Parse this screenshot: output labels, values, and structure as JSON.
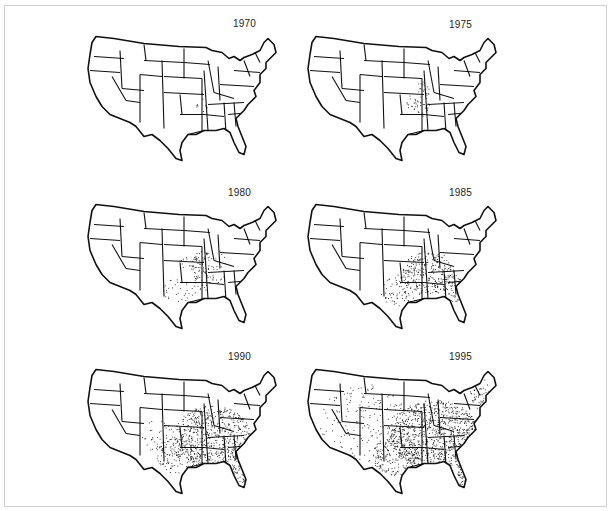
{
  "figure": {
    "panels": [
      {
        "year": "1970",
        "density": 0.02,
        "core": "arkansas"
      },
      {
        "year": "1975",
        "density": 0.08,
        "core": "arkansas-missouri"
      },
      {
        "year": "1980",
        "density": 0.18,
        "core": "south-central"
      },
      {
        "year": "1985",
        "density": 0.35,
        "core": "south"
      },
      {
        "year": "1990",
        "density": 0.6,
        "core": "south-midwest"
      },
      {
        "year": "1995",
        "density": 0.85,
        "core": "nationwide"
      }
    ]
  },
  "colors": {
    "ink": "#111111",
    "background": "#ffffff",
    "frame": "#cfcfcf"
  }
}
